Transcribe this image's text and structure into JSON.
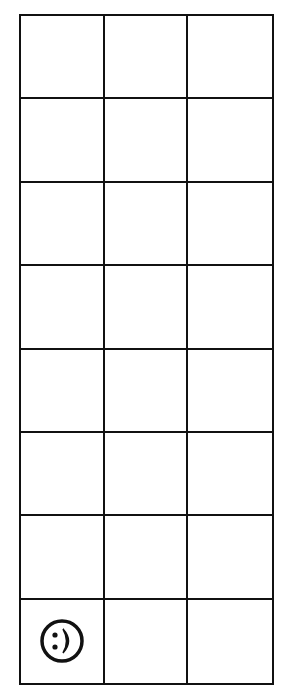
{
  "board": {
    "columns": 3,
    "rows": 8,
    "line_color": "#111111",
    "background": "#ffffff",
    "cells": [
      [
        "",
        "",
        ""
      ],
      [
        "",
        "",
        ""
      ],
      [
        "",
        "",
        ""
      ],
      [
        "",
        "",
        ""
      ],
      [
        "",
        "",
        ""
      ],
      [
        "",
        "",
        ""
      ],
      [
        "",
        "",
        ""
      ],
      [
        "smiley-face",
        "",
        ""
      ]
    ]
  },
  "player": {
    "icon": "smiley-face-icon",
    "row": 8,
    "column": 1
  }
}
